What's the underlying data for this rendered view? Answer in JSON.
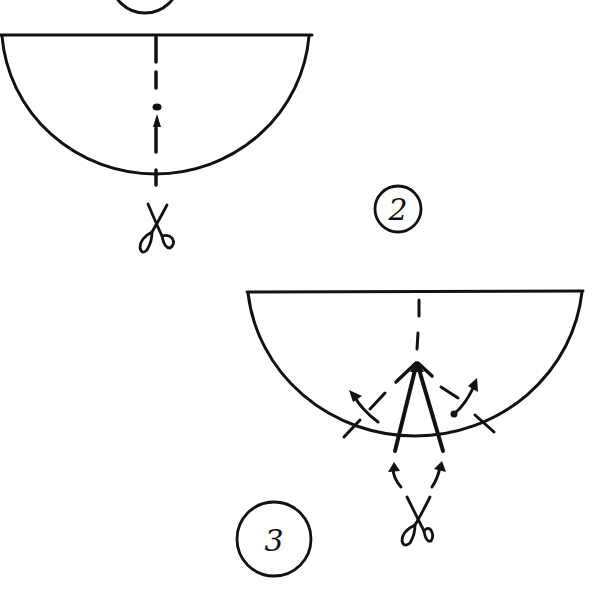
{
  "diagram": {
    "type": "instructional-line-drawing",
    "background": "#ffffff",
    "ink_color": "#111111",
    "steps": [
      {
        "label": "1",
        "visible": "partial (circle bottom only at top edge)"
      },
      {
        "label": "2",
        "description": "Semicircle with dashed center line; cut from bottom edge upward along center",
        "elements": [
          "semicircle",
          "dashed-center-line",
          "cut-arrow-up",
          "scissors-icon"
        ]
      },
      {
        "label": "3",
        "description": "Semicircle with V-shaped cut from bottom; flaps folded outward along dashed lines",
        "elements": [
          "semicircle",
          "dashed-center-line",
          "v-cut",
          "fold-lines",
          "fold-arrows",
          "cut-arrows",
          "scissors-icon"
        ]
      }
    ]
  },
  "labels": {
    "step2": "2",
    "step3": "3"
  }
}
